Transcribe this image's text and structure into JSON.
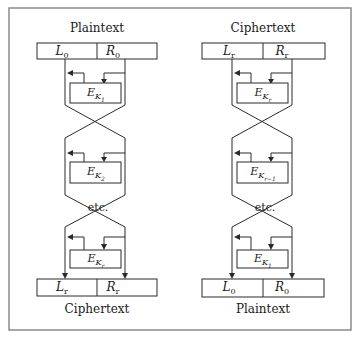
{
  "diagram": {
    "type": "feistel-network",
    "left_panel": {
      "name": "encryption",
      "top_label": "Plaintext",
      "top_left": {
        "var": "L",
        "sub": "0"
      },
      "top_right": {
        "var": "R",
        "sub": "0"
      },
      "rounds": [
        {
          "func": "E",
          "key": "K",
          "key_sub": "1"
        },
        {
          "func": "E",
          "key": "K",
          "key_sub": "2"
        },
        {
          "func": "E",
          "key": "K",
          "key_sub": "r"
        }
      ],
      "continuation": "etc.",
      "bottom_left": {
        "var": "L",
        "sub": "r"
      },
      "bottom_right": {
        "var": "R",
        "sub": "r"
      },
      "bottom_label": "Ciphertext"
    },
    "right_panel": {
      "name": "decryption",
      "top_label": "Ciphertext",
      "top_left": {
        "var": "L",
        "sub": "r"
      },
      "top_right": {
        "var": "R",
        "sub": "r"
      },
      "rounds": [
        {
          "func": "E",
          "key": "K",
          "key_sub": "r"
        },
        {
          "func": "E",
          "key": "K",
          "key_sub": "r−1"
        },
        {
          "func": "E",
          "key": "K",
          "key_sub": "1"
        }
      ],
      "continuation": "etc.",
      "bottom_left": {
        "var": "L",
        "sub": "0"
      },
      "bottom_right": {
        "var": "R",
        "sub": "0"
      },
      "bottom_label": "Plaintext"
    }
  }
}
